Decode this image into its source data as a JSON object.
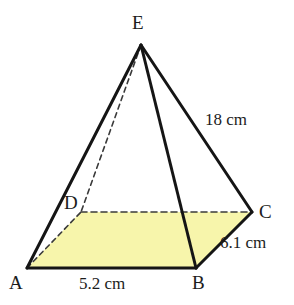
{
  "figure": {
    "shape_type": "pyramid",
    "background_color": "#ffffff",
    "base_fill_color": "#f7f5ab",
    "stroke_color": "#1a1a1a",
    "dash_color": "#3a3a3a",
    "text_color": "#1c1c1c"
  },
  "vertices": {
    "E": {
      "label": "E",
      "x": 141,
      "y": 45,
      "hidden": false
    },
    "D": {
      "label": "D",
      "x": 81,
      "y": 212,
      "hidden": true
    },
    "C": {
      "label": "C",
      "x": 252,
      "y": 212,
      "hidden": false
    },
    "A": {
      "label": "A",
      "x": 27,
      "y": 268,
      "hidden": false
    },
    "B": {
      "label": "B",
      "x": 196,
      "y": 268,
      "hidden": false
    }
  },
  "edges": [
    {
      "name": "EA",
      "from": "E",
      "to": "A",
      "style": "solid"
    },
    {
      "name": "EB",
      "from": "E",
      "to": "B",
      "style": "solid"
    },
    {
      "name": "EC",
      "from": "E",
      "to": "C",
      "style": "solid"
    },
    {
      "name": "ED",
      "from": "E",
      "to": "D",
      "style": "dashed"
    },
    {
      "name": "AB",
      "from": "A",
      "to": "B",
      "style": "solid"
    },
    {
      "name": "BC",
      "from": "B",
      "to": "C",
      "style": "solid"
    },
    {
      "name": "DC",
      "from": "D",
      "to": "C",
      "style": "dashed"
    },
    {
      "name": "AD",
      "from": "A",
      "to": "D",
      "style": "dashed"
    }
  ],
  "measurements": {
    "edge_ec": "18 cm",
    "edge_bc": "6.1 cm",
    "edge_ab": "5.2 cm"
  }
}
